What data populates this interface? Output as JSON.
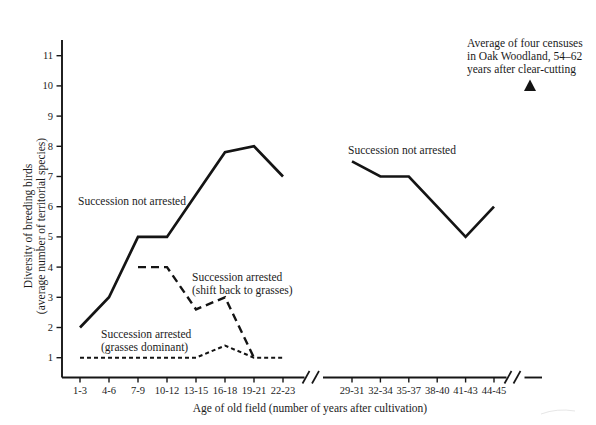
{
  "figure": {
    "xlabel": "Age of old field (number of years after cultivation)",
    "ylabel": [
      "Diversity of breeding birds",
      "(average number of territorial species)"
    ],
    "annotations": {
      "left_solid": "Succession not arrested",
      "right_solid": "Succession not arrested",
      "dashed": [
        "Succession arrested",
        "(shift back to grasses)"
      ],
      "dotted": [
        "Succession arrested",
        "(grasses dominant)"
      ],
      "oak": [
        "Average of four censuses",
        "in Oak Woodland, 54–62",
        "years after clear-cutting"
      ]
    },
    "colors": {
      "line": "#141414",
      "text": "#1b1b1b",
      "background": "#ffffff"
    }
  },
  "chart_data": {
    "type": "line",
    "title": "",
    "xlabel": "Age of old field (number of years after cultivation)",
    "ylabel": "Diversity of breeding birds (average number of territorial species)",
    "y_ticks": [
      1,
      2,
      3,
      4,
      5,
      6,
      7,
      8,
      9,
      10,
      11
    ],
    "ylim": [
      0.3,
      11.7
    ],
    "grid": false,
    "axis_breaks": [
      "between 22-23 and 29-31",
      "after 44-45"
    ],
    "x_groups": [
      {
        "categories": [
          "1-3",
          "4-6",
          "7-9",
          "10-12",
          "13-15",
          "16-18",
          "19-21",
          "22-23"
        ]
      },
      {
        "categories": [
          "29-31",
          "32-34",
          "35-37",
          "38-40",
          "41-43",
          "44-45"
        ]
      }
    ],
    "series": [
      {
        "id": "not-arrested-left",
        "name": "Succession not arrested",
        "style": "solid",
        "group": 0,
        "start_index": 0,
        "values": [
          2,
          3,
          5,
          5,
          6.4,
          7.8,
          8,
          7
        ]
      },
      {
        "id": "not-arrested-right",
        "name": "Succession not arrested",
        "style": "solid",
        "group": 1,
        "start_index": 0,
        "values": [
          7.5,
          7,
          7,
          6,
          5,
          6
        ]
      },
      {
        "id": "arrested-shift-back",
        "name": "Succession arrested (shift back to grasses)",
        "style": "dashed",
        "group": 0,
        "start_index": 2,
        "values": [
          4,
          4,
          2.6,
          3,
          1
        ]
      },
      {
        "id": "arrested-grasses",
        "name": "Succession arrested (grasses dominant)",
        "style": "dotted",
        "group": 0,
        "start_index": 0,
        "values": [
          1,
          1,
          1,
          1,
          1,
          1.4,
          1,
          1
        ]
      }
    ],
    "marker": {
      "symbol": "filled-triangle",
      "value": 10,
      "label": "Average of four censuses in Oak Woodland, 54–62 years after clear-cutting"
    }
  }
}
